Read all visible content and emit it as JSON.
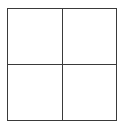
{
  "diagram": {
    "type": "grid",
    "rows": 2,
    "columns": 2,
    "cells": [
      {
        "row": 0,
        "col": 0,
        "label": ""
      },
      {
        "row": 0,
        "col": 1,
        "label": ""
      },
      {
        "row": 1,
        "col": 0,
        "label": ""
      },
      {
        "row": 1,
        "col": 1,
        "label": ""
      }
    ],
    "colors": {
      "line": "#3a3a3a",
      "fill": "#ffffff",
      "background": "#ffffff"
    }
  }
}
